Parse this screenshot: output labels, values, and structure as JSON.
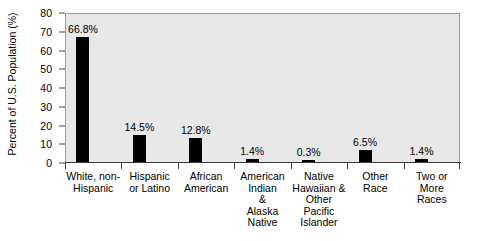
{
  "chart_data": {
    "type": "bar",
    "title": "",
    "xlabel": "",
    "ylabel": "Percent of U.S. Population (%)",
    "ylim": [
      0,
      80
    ],
    "ytick_step": 10,
    "yticks": [
      "80",
      "70",
      "60",
      "50",
      "40",
      "30",
      "20",
      "10",
      "0"
    ],
    "grid": false,
    "legend": "none",
    "bar_color": "#000000",
    "plot_background": "#e8e8e8",
    "categories": [
      "White, non-\nHispanic",
      "Hispanic\nor Latino",
      "African\nAmerican",
      "American\nIndian\n&\nAlaska\nNative",
      "Native\nHawaiian &\nOther\nPacific\nIslander",
      "Other\nRace",
      "Two or\nMore\nRaces"
    ],
    "values": [
      66.8,
      14.5,
      12.8,
      1.4,
      0.3,
      6.5,
      1.4
    ],
    "data_labels": [
      "66.8%",
      "14.5%",
      "12.8%",
      "1.4%",
      "0.3%",
      "6.5%",
      "1.4%"
    ]
  }
}
